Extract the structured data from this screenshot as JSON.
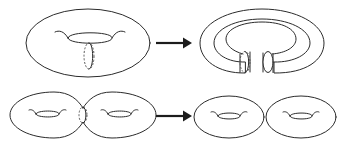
{
  "figure": {
    "title": "Cutting surfaces along a circle",
    "background_color": "#ffffff",
    "stroke_color": "#2b2b2b",
    "dashed_stroke_color": "#5a5a5a",
    "arrow_color": "#1c1c1c",
    "canvas": {
      "width": 338,
      "height": 151
    },
    "rows": [
      {
        "row_name": "torus-cut-row",
        "left_shape_label": "torus",
        "right_shape_label": "cut-open-torus-cylinder",
        "arrow_label": "cut along dashed circle"
      },
      {
        "row_name": "genus-two-cut-row",
        "left_shape_label": "genus-two-surface",
        "right_shape_label": "two-separate-tori",
        "arrow_label": "cut along dashed circle"
      }
    ],
    "shapes": {
      "torus": {
        "name": "torus",
        "outer_ellipse": {
          "cx": 88,
          "cy": 43,
          "rx": 62,
          "ry": 34
        },
        "hole": {
          "cx": 90,
          "cy": 38,
          "rx": 22,
          "ry": 7
        },
        "cut_circle": {
          "cx": 89,
          "cy": 56,
          "rx": 5,
          "ry": 13,
          "style": "dashed"
        }
      },
      "cut_open_torus": {
        "name": "cut-open-torus-cylinder",
        "outer_ellipse": {
          "cx": 262,
          "cy": 43,
          "rx": 62,
          "ry": 34
        },
        "hole": {
          "cx": 260,
          "cy": 40,
          "rx": 26,
          "ry": 14
        },
        "left_tube_end": {
          "cx": 245,
          "cy": 62,
          "rx": 5,
          "ry": 11,
          "style": "dashed"
        },
        "right_tube_end": {
          "cx": 268,
          "cy": 62,
          "rx": 5,
          "ry": 11,
          "style": "solid"
        }
      },
      "genus_two_surface": {
        "name": "genus-two-surface",
        "left_lobe": {
          "cx": 47,
          "cy": 115,
          "rx": 40,
          "ry": 23
        },
        "right_lobe": {
          "cx": 120,
          "cy": 115,
          "rx": 40,
          "ry": 23
        },
        "left_hole": {
          "cx": 47,
          "cy": 114,
          "rx": 12,
          "ry": 4
        },
        "right_hole": {
          "cx": 120,
          "cy": 114,
          "rx": 12,
          "ry": 4
        },
        "cut_circle": {
          "cx": 83,
          "cy": 115,
          "rx": 4,
          "ry": 8,
          "style": "dashed"
        }
      },
      "two_tori": {
        "name": "two-separate-tori",
        "first": {
          "outer_ellipse": {
            "cx": 229,
            "cy": 117,
            "rx": 35,
            "ry": 21
          },
          "hole": {
            "cx": 229,
            "cy": 116,
            "rx": 11,
            "ry": 4
          }
        },
        "second": {
          "outer_ellipse": {
            "cx": 301,
            "cy": 117,
            "rx": 35,
            "ry": 21
          },
          "hole": {
            "cx": 301,
            "cy": 116,
            "rx": 11,
            "ry": 4
          }
        }
      }
    },
    "arrows": [
      {
        "name": "arrow-top",
        "x1": 156,
        "x2": 190,
        "y": 43
      },
      {
        "name": "arrow-bottom",
        "x1": 156,
        "x2": 190,
        "y": 116
      }
    ]
  }
}
